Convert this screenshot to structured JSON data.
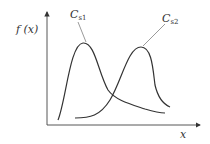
{
  "diagram": {
    "y_axis_label": "f (x)",
    "x_axis_label": "x",
    "curves": [
      {
        "name": "C",
        "subscript": "s1",
        "shape": "peak early, long right tail"
      },
      {
        "name": "C",
        "subscript": "s2",
        "shape": "peak late, steep drop"
      }
    ],
    "colors": {
      "line": "#333333",
      "background": "#ffffff"
    }
  }
}
